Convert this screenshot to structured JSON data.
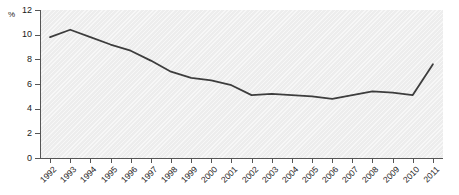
{
  "chart_data": {
    "type": "line",
    "title": "",
    "xlabel": "",
    "ylabel": "%",
    "unit_label": "%",
    "categories": [
      "1992",
      "1993",
      "1994",
      "1995",
      "1996",
      "1997",
      "1998",
      "1999",
      "2000",
      "2001",
      "2002",
      "2003",
      "2004",
      "2005",
      "2006",
      "2007",
      "2008",
      "2009",
      "2010",
      "2011"
    ],
    "values": [
      9.8,
      10.4,
      9.8,
      9.2,
      8.7,
      7.9,
      7.0,
      6.5,
      6.3,
      5.9,
      5.1,
      5.2,
      5.1,
      5.0,
      4.8,
      5.1,
      5.4,
      5.3,
      5.1,
      7.6
    ],
    "series": [
      {
        "name": "unemployment-rate",
        "values": [
          9.8,
          10.4,
          9.8,
          9.2,
          8.7,
          7.9,
          7.0,
          6.5,
          6.3,
          5.9,
          5.1,
          5.2,
          5.1,
          5.0,
          4.8,
          5.1,
          5.4,
          5.3,
          5.1,
          7.6
        ],
        "color": "#3d3d3d"
      }
    ],
    "ylim": [
      0,
      12
    ],
    "yticks": [
      0,
      2,
      4,
      6,
      8,
      10,
      12
    ],
    "ytick_labels": [
      "0",
      "2",
      "4",
      "6",
      "8",
      "10",
      "12"
    ],
    "grid": false,
    "legend": null,
    "legend_position": "none",
    "plot_background": "#ededed",
    "line_color": "#3d3d3d",
    "axis_color": "#555555",
    "text_color": "#1a1a1a"
  }
}
